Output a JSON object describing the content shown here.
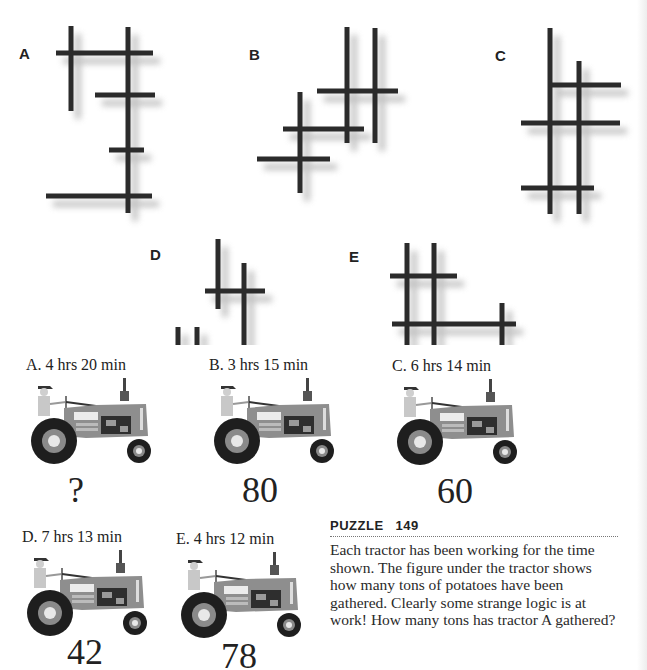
{
  "figures": {
    "labels": [
      "A",
      "B",
      "C",
      "D",
      "E"
    ]
  },
  "tractors": [
    {
      "label": "A. 4 hrs 20 min",
      "value": "?"
    },
    {
      "label": "B. 3 hrs 15 min",
      "value": "80"
    },
    {
      "label": "C. 6 hrs 14 min",
      "value": "60"
    },
    {
      "label": "D. 7 hrs 13 min",
      "value": "42"
    },
    {
      "label": "E. 4 hrs 12 min",
      "value": "78"
    }
  ],
  "puzzle": {
    "heading": "PUZZLE",
    "number": "149",
    "text": "Each tractor has been working for the time shown. The figure under the tractor shows how many tons of potatoes have been gathered. Clearly some strange logic is at work! How many tons has tractor A gathered?"
  },
  "colors": {
    "line": "#2b2b2b",
    "shadow": "#bdbdbd"
  }
}
